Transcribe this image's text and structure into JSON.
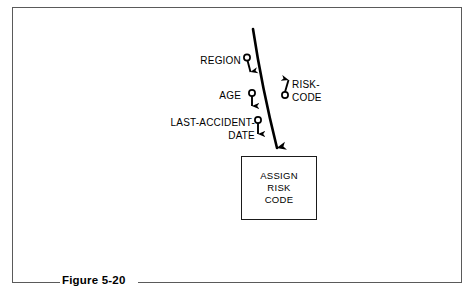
{
  "figure": {
    "caption": "Figure 5-20",
    "frame_color": "#5a5a5a",
    "ink_color": "#000000"
  },
  "diagram": {
    "type": "structure-chart-data-couples",
    "module": {
      "name": "assign-risk-code",
      "lines": [
        "ASSIGN",
        "RISK",
        "CODE"
      ]
    },
    "inputs": [
      {
        "name": "region",
        "label": "REGION",
        "lines": [
          "REGION"
        ],
        "direction": "in"
      },
      {
        "name": "age",
        "label": "AGE",
        "lines": [
          "AGE"
        ],
        "direction": "in"
      },
      {
        "name": "last-accident-date",
        "label": "LAST-ACCIDENT-DATE",
        "lines": [
          "LAST-ACCIDENT-",
          "DATE"
        ],
        "direction": "in"
      }
    ],
    "outputs": [
      {
        "name": "risk-code",
        "label": "RISK-CODE",
        "lines": [
          "RISK-",
          "CODE"
        ],
        "direction": "out"
      }
    ]
  }
}
